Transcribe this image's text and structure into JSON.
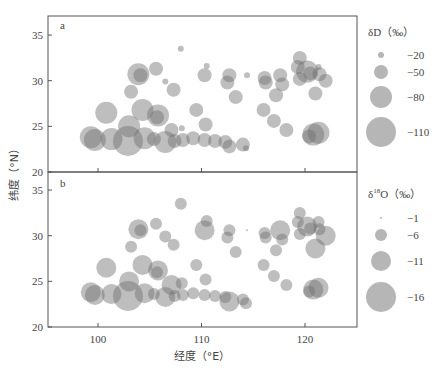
{
  "chart_data": [
    {
      "type": "scatter",
      "subtype": "bubble",
      "panel": "a",
      "xlabel": "经度（°E）",
      "ylabel": "纬度（°N）",
      "xlim": [
        95,
        125
      ],
      "ylim": [
        20,
        37
      ],
      "xticks": [
        100,
        110,
        120
      ],
      "yticks": [
        20,
        25,
        30,
        35
      ],
      "size_variable": "δD (‰)",
      "legend": {
        "title": "δD（‰）",
        "entries": [
          -20,
          -50,
          -80,
          -110
        ]
      },
      "points": [
        {
          "lon": 108.0,
          "lat": 33.5,
          "value": -20
        },
        {
          "lon": 121.3,
          "lat": 31.5,
          "value": -20
        },
        {
          "lon": 110.5,
          "lat": 31.6,
          "value": -20
        },
        {
          "lon": 103.9,
          "lat": 30.7,
          "value": -80
        },
        {
          "lon": 104.1,
          "lat": 30.6,
          "value": -50
        },
        {
          "lon": 105.6,
          "lat": 31.3,
          "value": -50
        },
        {
          "lon": 106.5,
          "lat": 29.9,
          "value": -20
        },
        {
          "lon": 107.3,
          "lat": 29.0,
          "value": -50
        },
        {
          "lon": 103.2,
          "lat": 28.8,
          "value": -50
        },
        {
          "lon": 110.3,
          "lat": 30.6,
          "value": -50
        },
        {
          "lon": 100.8,
          "lat": 26.5,
          "value": -80
        },
        {
          "lon": 104.3,
          "lat": 26.8,
          "value": -80
        },
        {
          "lon": 105.8,
          "lat": 26.2,
          "value": -80
        },
        {
          "lon": 105.7,
          "lat": 26.0,
          "value": -50
        },
        {
          "lon": 109.5,
          "lat": 26.8,
          "value": -50
        },
        {
          "lon": 110.4,
          "lat": 25.2,
          "value": -50
        },
        {
          "lon": 107.1,
          "lat": 24.6,
          "value": -50
        },
        {
          "lon": 108.1,
          "lat": 24.8,
          "value": -20
        },
        {
          "lon": 99.3,
          "lat": 23.8,
          "value": -80
        },
        {
          "lon": 99.7,
          "lat": 23.5,
          "value": -80
        },
        {
          "lon": 101.3,
          "lat": 23.6,
          "value": -80
        },
        {
          "lon": 102.9,
          "lat": 23.4,
          "value": -110
        },
        {
          "lon": 103.0,
          "lat": 25.0,
          "value": -80
        },
        {
          "lon": 104.5,
          "lat": 23.7,
          "value": -80
        },
        {
          "lon": 105.4,
          "lat": 23.6,
          "value": -50
        },
        {
          "lon": 106.5,
          "lat": 23.3,
          "value": -80
        },
        {
          "lon": 107.4,
          "lat": 23.4,
          "value": -50
        },
        {
          "lon": 108.2,
          "lat": 23.5,
          "value": -50
        },
        {
          "lon": 109.2,
          "lat": 23.7,
          "value": -50
        },
        {
          "lon": 110.3,
          "lat": 23.5,
          "value": -50
        },
        {
          "lon": 111.3,
          "lat": 23.4,
          "value": -50
        },
        {
          "lon": 112.7,
          "lat": 22.8,
          "value": -50
        },
        {
          "lon": 114.0,
          "lat": 23.0,
          "value": -50
        },
        {
          "lon": 114.3,
          "lat": 22.6,
          "value": -20
        },
        {
          "lon": 112.3,
          "lat": 23.3,
          "value": -50
        },
        {
          "lon": 112.5,
          "lat": 29.8,
          "value": -50
        },
        {
          "lon": 112.7,
          "lat": 30.6,
          "value": -50
        },
        {
          "lon": 113.3,
          "lat": 28.2,
          "value": -50
        },
        {
          "lon": 114.4,
          "lat": 30.6,
          "value": -20
        },
        {
          "lon": 116.2,
          "lat": 29.8,
          "value": -50
        },
        {
          "lon": 116.1,
          "lat": 30.3,
          "value": -50
        },
        {
          "lon": 117.2,
          "lat": 28.4,
          "value": -50
        },
        {
          "lon": 117.6,
          "lat": 30.6,
          "value": -50
        },
        {
          "lon": 117.8,
          "lat": 29.6,
          "value": -50
        },
        {
          "lon": 116.0,
          "lat": 26.8,
          "value": -50
        },
        {
          "lon": 117.0,
          "lat": 25.6,
          "value": -50
        },
        {
          "lon": 118.2,
          "lat": 24.6,
          "value": -50
        },
        {
          "lon": 119.5,
          "lat": 32.5,
          "value": -50
        },
        {
          "lon": 119.3,
          "lat": 31.5,
          "value": -50
        },
        {
          "lon": 120.2,
          "lat": 31.0,
          "value": -80
        },
        {
          "lon": 120.5,
          "lat": 30.8,
          "value": -50
        },
        {
          "lon": 121.4,
          "lat": 30.7,
          "value": -50
        },
        {
          "lon": 119.5,
          "lat": 30.2,
          "value": -50
        },
        {
          "lon": 122.0,
          "lat": 30.0,
          "value": -50
        },
        {
          "lon": 121.0,
          "lat": 28.6,
          "value": -50
        },
        {
          "lon": 120.8,
          "lat": 24.1,
          "value": -80
        },
        {
          "lon": 121.3,
          "lat": 24.3,
          "value": -80
        },
        {
          "lon": 120.4,
          "lat": 23.9,
          "value": -50
        }
      ]
    },
    {
      "type": "scatter",
      "subtype": "bubble",
      "panel": "b",
      "xlabel": "经度（°E）",
      "ylabel": "纬度（°N）",
      "xlim": [
        95,
        125
      ],
      "ylim": [
        20,
        37
      ],
      "xticks": [
        100,
        110,
        120
      ],
      "yticks": [
        20,
        25,
        30,
        35
      ],
      "size_variable": "δ18O (‰)",
      "legend": {
        "title": "δ18O（‰）",
        "entries": [
          -1,
          -6,
          -11,
          -16
        ]
      },
      "points": [
        {
          "lon": 108.0,
          "lat": 33.5,
          "value": -6
        },
        {
          "lon": 121.3,
          "lat": 31.5,
          "value": -6
        },
        {
          "lon": 110.5,
          "lat": 31.6,
          "value": -6
        },
        {
          "lon": 103.9,
          "lat": 30.7,
          "value": -11
        },
        {
          "lon": 104.1,
          "lat": 30.6,
          "value": -6
        },
        {
          "lon": 105.6,
          "lat": 31.3,
          "value": -6
        },
        {
          "lon": 106.5,
          "lat": 29.9,
          "value": -6
        },
        {
          "lon": 107.3,
          "lat": 29.0,
          "value": -6
        },
        {
          "lon": 103.2,
          "lat": 28.8,
          "value": -6
        },
        {
          "lon": 110.3,
          "lat": 30.6,
          "value": -11
        },
        {
          "lon": 100.8,
          "lat": 26.5,
          "value": -11
        },
        {
          "lon": 104.3,
          "lat": 26.8,
          "value": -11
        },
        {
          "lon": 105.8,
          "lat": 26.2,
          "value": -11
        },
        {
          "lon": 105.7,
          "lat": 26.0,
          "value": -6
        },
        {
          "lon": 109.5,
          "lat": 26.8,
          "value": -6
        },
        {
          "lon": 110.4,
          "lat": 25.2,
          "value": -6
        },
        {
          "lon": 107.1,
          "lat": 24.6,
          "value": -11
        },
        {
          "lon": 108.1,
          "lat": 24.8,
          "value": -6
        },
        {
          "lon": 99.3,
          "lat": 23.8,
          "value": -11
        },
        {
          "lon": 99.7,
          "lat": 23.5,
          "value": -11
        },
        {
          "lon": 101.3,
          "lat": 23.6,
          "value": -11
        },
        {
          "lon": 102.9,
          "lat": 23.4,
          "value": -16
        },
        {
          "lon": 103.0,
          "lat": 25.0,
          "value": -11
        },
        {
          "lon": 104.5,
          "lat": 23.7,
          "value": -11
        },
        {
          "lon": 105.4,
          "lat": 23.6,
          "value": -6
        },
        {
          "lon": 106.5,
          "lat": 23.3,
          "value": -11
        },
        {
          "lon": 107.4,
          "lat": 23.4,
          "value": -6
        },
        {
          "lon": 108.2,
          "lat": 23.5,
          "value": -6
        },
        {
          "lon": 109.2,
          "lat": 23.7,
          "value": -6
        },
        {
          "lon": 110.3,
          "lat": 23.5,
          "value": -6
        },
        {
          "lon": 111.3,
          "lat": 23.4,
          "value": -6
        },
        {
          "lon": 112.7,
          "lat": 22.8,
          "value": -11
        },
        {
          "lon": 114.0,
          "lat": 23.0,
          "value": -6
        },
        {
          "lon": 114.3,
          "lat": 22.6,
          "value": -6
        },
        {
          "lon": 112.3,
          "lat": 23.3,
          "value": -6
        },
        {
          "lon": 112.5,
          "lat": 29.8,
          "value": -6
        },
        {
          "lon": 112.7,
          "lat": 30.6,
          "value": -6
        },
        {
          "lon": 113.3,
          "lat": 28.2,
          "value": -6
        },
        {
          "lon": 114.4,
          "lat": 30.6,
          "value": -1
        },
        {
          "lon": 116.2,
          "lat": 29.8,
          "value": -6
        },
        {
          "lon": 116.1,
          "lat": 30.3,
          "value": -6
        },
        {
          "lon": 117.2,
          "lat": 28.4,
          "value": -6
        },
        {
          "lon": 117.6,
          "lat": 30.6,
          "value": -11
        },
        {
          "lon": 117.8,
          "lat": 29.6,
          "value": -6
        },
        {
          "lon": 116.0,
          "lat": 26.8,
          "value": -6
        },
        {
          "lon": 117.0,
          "lat": 25.6,
          "value": -6
        },
        {
          "lon": 118.2,
          "lat": 24.6,
          "value": -6
        },
        {
          "lon": 119.5,
          "lat": 32.5,
          "value": -6
        },
        {
          "lon": 119.3,
          "lat": 31.5,
          "value": -6
        },
        {
          "lon": 120.2,
          "lat": 31.0,
          "value": -11
        },
        {
          "lon": 120.5,
          "lat": 30.8,
          "value": -6
        },
        {
          "lon": 121.4,
          "lat": 30.7,
          "value": -6
        },
        {
          "lon": 119.5,
          "lat": 30.2,
          "value": -6
        },
        {
          "lon": 122.0,
          "lat": 30.0,
          "value": -11
        },
        {
          "lon": 121.0,
          "lat": 28.6,
          "value": -11
        },
        {
          "lon": 120.8,
          "lat": 24.1,
          "value": -11
        },
        {
          "lon": 121.3,
          "lat": 24.3,
          "value": -11
        },
        {
          "lon": 120.4,
          "lat": 23.9,
          "value": -6
        }
      ]
    }
  ],
  "labels": {
    "panel_a": "a",
    "panel_b": "b",
    "xlabel": "经度（°E）",
    "ylabel": "纬度（°N）",
    "legend_a_title": "δD（‰）",
    "legend_b_title_delta": "δ",
    "legend_b_title_sup": "18",
    "legend_b_title_rest": "O（‰）"
  },
  "legend_a": [
    {
      "label": "−20",
      "r": 3
    },
    {
      "label": "−50",
      "r": 7
    },
    {
      "label": "−80",
      "r": 11
    },
    {
      "label": "−110",
      "r": 15
    }
  ],
  "legend_b": [
    {
      "label": "−1",
      "r": 1
    },
    {
      "label": "−6",
      "r": 6
    },
    {
      "label": "−11",
      "r": 10
    },
    {
      "label": "−16",
      "r": 15
    }
  ],
  "colors": {
    "bubble": "#6e6e6e",
    "axis": "#555555",
    "background": "#ffffff"
  }
}
